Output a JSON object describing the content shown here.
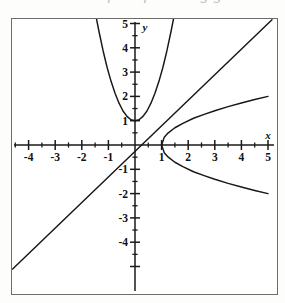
{
  "page": {
    "top_cut_text": "Match each of the following graphs"
  },
  "figure": {
    "frame": {
      "x": 11,
      "y": 18,
      "width": 267,
      "height": 277
    },
    "origin_px": {
      "x": 134,
      "y": 144
    },
    "unit_px": {
      "x": 26.6,
      "y": 24.3
    }
  },
  "chart_data": {
    "type": "line",
    "title": "",
    "subtitle": "",
    "xlabel": "x",
    "ylabel": "y",
    "xlim": [
      -5.05,
      5.4
    ],
    "ylim": [
      -5.2,
      5.4
    ],
    "grid": false,
    "legend": null,
    "axis": {
      "x_tick_labels": [
        "-4",
        "-3",
        "-2",
        "-1",
        "1",
        "2",
        "3",
        "4",
        "5"
      ],
      "x_tick_values": [
        -4,
        -3,
        -2,
        -1,
        1,
        2,
        3,
        4,
        5
      ],
      "x_minor_step": 0.5,
      "y_tick_labels": [
        "5",
        "4",
        "3",
        "2",
        "1",
        "-1",
        "-2",
        "-3",
        "-4"
      ],
      "y_tick_values": [
        5,
        4,
        3,
        2,
        1,
        -1,
        -2,
        -3,
        -4
      ],
      "y_minor_step": 0.5,
      "x_axis_name": "x",
      "y_axis_name": "y"
    },
    "series": [
      {
        "name": "parabola",
        "equation": "y = 2x^2 + 1",
        "color": "#171717",
        "points_x": [
          -1.46,
          -1.35,
          -1.2,
          -1.05,
          -0.9,
          -0.75,
          -0.6,
          -0.45,
          -0.3,
          -0.15,
          0,
          0.15,
          0.3,
          0.45,
          0.6,
          0.75,
          0.9,
          1.05,
          1.2,
          1.35,
          1.46
        ],
        "points_y": [
          5.26,
          4.65,
          3.88,
          3.2,
          2.62,
          2.13,
          1.72,
          1.4,
          1.18,
          1.04,
          1.0,
          1.04,
          1.18,
          1.4,
          1.72,
          2.13,
          2.62,
          3.2,
          3.88,
          4.65,
          5.26
        ]
      },
      {
        "name": "line",
        "equation": "y = x",
        "color": "#171717",
        "points_x": [
          -4.6,
          5.15
        ],
        "points_y": [
          -5.1,
          5.15
        ]
      },
      {
        "name": "sideways-parabola-upper",
        "equation": "y = sqrt(x - 1)",
        "color": "#171717",
        "points_x": [
          1.0,
          1.1,
          1.25,
          1.5,
          1.8,
          2.2,
          2.6,
          3.0,
          3.5,
          4.0,
          4.5,
          5.0
        ],
        "points_y": [
          0.0,
          0.32,
          0.5,
          0.71,
          0.89,
          1.1,
          1.26,
          1.41,
          1.58,
          1.73,
          1.87,
          2.0
        ]
      },
      {
        "name": "sideways-parabola-lower",
        "equation": "y = -sqrt(x - 1)",
        "color": "#171717",
        "points_x": [
          1.0,
          1.1,
          1.25,
          1.5,
          1.8,
          2.2,
          2.6,
          3.0,
          3.5,
          4.0,
          4.5,
          5.0
        ],
        "points_y": [
          0.0,
          -0.32,
          -0.5,
          -0.71,
          -0.89,
          -1.1,
          -1.26,
          -1.41,
          -1.58,
          -1.73,
          -1.87,
          -2.0
        ]
      }
    ],
    "annotations": []
  }
}
